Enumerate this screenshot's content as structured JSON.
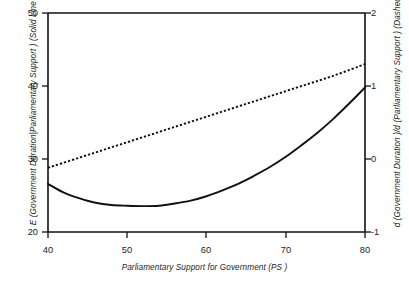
{
  "chart_data": {
    "type": "line",
    "title": "",
    "xlabel": "Parliamentary Support for Government (PS )",
    "ylabel_left": "E (Government Duration|Parliamentary Support ) (Solid Line )",
    "ylabel_right": "d (Government Duration )/d (Parliamentary Support ) (Dashed Line )",
    "xlim": [
      40,
      80
    ],
    "ylim_left": [
      20,
      50
    ],
    "ylim_right": [
      -1,
      2
    ],
    "xticks": [
      "40",
      "50",
      "60",
      "70",
      "80"
    ],
    "xtick_values": [
      40,
      50,
      60,
      70,
      80
    ],
    "yticks_left": [
      "50",
      "40",
      "30",
      "20"
    ],
    "ytick_values_left": [
      50,
      40,
      30,
      20
    ],
    "yticks_right": [
      "2",
      "1",
      "0",
      "-1"
    ],
    "ytick_values_right": [
      2,
      1,
      0,
      -1
    ],
    "grid": false,
    "legend_position": "none",
    "series": [
      {
        "name": "E (Government Duration|Parliamentary Support )",
        "style": "solid",
        "axis": "left",
        "color": "#111111",
        "x": [
          40,
          42,
          44,
          46,
          48,
          50,
          52,
          54,
          56,
          58,
          60,
          62,
          64,
          66,
          68,
          70,
          72,
          74,
          76,
          78,
          80
        ],
        "y": [
          26.6,
          25.4,
          24.6,
          24.0,
          23.7,
          23.6,
          23.55,
          23.6,
          23.9,
          24.3,
          24.9,
          25.7,
          26.6,
          27.7,
          28.9,
          30.3,
          31.9,
          33.6,
          35.5,
          37.6,
          39.8
        ]
      },
      {
        "name": "d (Government Duration )/d (Parliamentary Support )",
        "style": "dashed",
        "axis": "right",
        "color": "#111111",
        "x": [
          40,
          44,
          48,
          52,
          56,
          60,
          64,
          68,
          72,
          76,
          80
        ],
        "y": [
          -0.12,
          0.02,
          0.16,
          0.3,
          0.44,
          0.58,
          0.72,
          0.86,
          1.0,
          1.14,
          1.3
        ]
      }
    ]
  },
  "axes": {
    "x_title": "Parliamentary Support for Government (PS )",
    "y_left_title": "E (Government Duration|Parliamentary Support ) (Solid Line )",
    "y_right_title": "d (Government Duration )/d (Parliamentary Support ) (Dashed Line )",
    "x_ticks": [
      "40",
      "50",
      "60",
      "70",
      "80"
    ],
    "y_left_ticks": [
      "50",
      "40",
      "30",
      "20"
    ],
    "y_right_ticks": [
      "2",
      "1",
      "0",
      "-1"
    ]
  },
  "colors": {
    "axis": "#111111",
    "curve_solid": "#111111",
    "curve_dashed": "#111111",
    "background": "#ffffff"
  }
}
